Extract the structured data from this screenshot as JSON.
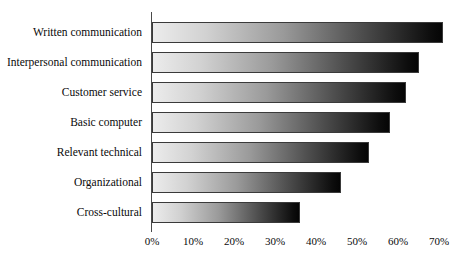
{
  "chart_data": {
    "type": "bar",
    "orientation": "horizontal",
    "title": "",
    "xlabel": "",
    "ylabel": "",
    "categories": [
      "Written communication",
      "Interpersonal communication",
      "Customer service",
      "Basic computer",
      "Relevant technical",
      "Organizational",
      "Cross-cultural"
    ],
    "values": [
      71,
      65,
      62,
      58,
      53,
      46,
      36
    ],
    "value_suffix": "%",
    "xlim": [
      0,
      71.7
    ],
    "xticks": [
      0,
      10,
      20,
      30,
      40,
      50,
      60,
      70
    ],
    "xtick_labels": [
      "0%",
      "10%",
      "20%",
      "30%",
      "40%",
      "50%",
      "60%",
      "70%"
    ],
    "grid": false,
    "legend": false,
    "bar_style": {
      "fill": "horizontal-gradient",
      "gradient_start": "#ececec",
      "gradient_end": "#050505",
      "border_color": "#3a3a3a"
    },
    "axis_color": "#4a4a4a",
    "background": "#ffffff"
  }
}
